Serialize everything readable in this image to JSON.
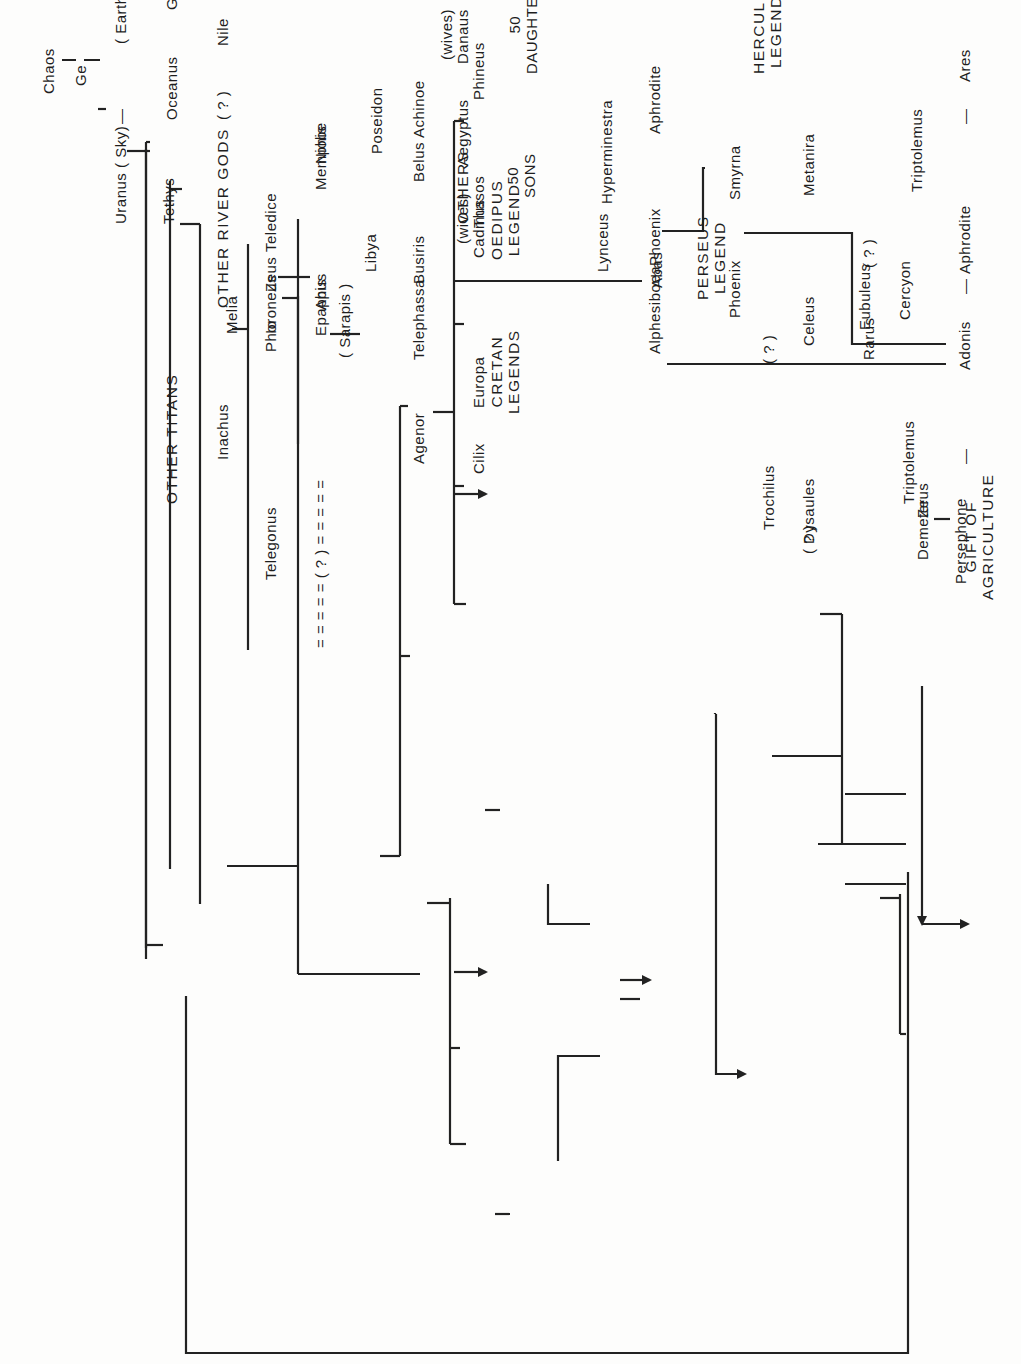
{
  "diagram": {
    "orientation": "rotated 90 degrees counter-clockwise",
    "line_color": "#222222",
    "labels": {
      "chaos": "Chaos",
      "ge_top": "Ge",
      "uranus": "Uranus ( Sky)",
      "earth_ge": "( Earth ) Ge",
      "tethys": "Tethys",
      "other_titans": "OTHER TITANS",
      "oceanus": "Oceanus",
      "ge_left": "Ge",
      "other_river_gods": "OTHER RIVER GODS",
      "inachus": "Inachus",
      "melia": "Melia",
      "phoroneus": "Phoroneus",
      "teledice": "Teledice",
      "niobe": "Niobe",
      "apis": "Apis",
      "sarapis": "( Sarapis )",
      "io": "Io",
      "telegonus": "Telegonus",
      "zeus_io": "Zeus",
      "epaphus": "Epaphus",
      "dashed_link": "= = = = = ( ? ) = = = = =",
      "memphis": "Memphis",
      "libya": "Libya",
      "nile": "Nile",
      "unknown_nile": "( ? )",
      "poseidon": "Poseidon",
      "belus": "Belus",
      "achinoe": "Achinoe",
      "aegyptus": "Aegyptus",
      "wives_aeg": "(wives)",
      "fifty_sons": "50\nSONS",
      "others": "OTHERS",
      "danaus": "Danaus",
      "wives_dan": "(wives)",
      "fifty_daughters": "50\nDAUGHTERS",
      "lynceus": "Lynceus",
      "hyperminestra": "Hyperminestra",
      "abas": "Abas",
      "perseus_legend": "PERSEUS\nLEGEND",
      "hercules_legends": "HERCULES\nLEGENDS",
      "busiris": "Busiris",
      "agenor": "Agenor",
      "telephassa": "Telephassa",
      "cadmus": "Cadmus",
      "oedipus_legend": "OEDIPUS\nLEGEND",
      "europa": "Europa",
      "cretan_legends": "CRETAN\nLEGENDS",
      "cilix": "Cilix",
      "thasos": "Thasos",
      "phineus": "Phineus",
      "phoenix_1": "Phoenix",
      "aphrodite_1": "Aphrodite",
      "alphesiboea": "Alphesiboea",
      "phoenix_2": "Phoenix",
      "smyrna": "Smyrna",
      "adonis": "Adonis",
      "aphrodite_2": "Aphrodite",
      "ares": "Ares",
      "dash_adonis_left": "—",
      "dash_adonis_right": "—",
      "dash_ares": "—",
      "metanira": "Metanira",
      "celeus": "Celeus",
      "unknown_trochilus": "( ? )",
      "trochilus": "Trochilus",
      "unknown_dysaules": "( ? )",
      "dysaules": "Dysaules",
      "eubuleus": "Eubuleus",
      "demeter": "Demeter",
      "zeus_dem": "Zeus",
      "persephone": "Persephone",
      "triptolemus_1": "Triptolemus",
      "triptolemus_2": "Triptolemus",
      "gift_of_agriculture": "GIFT OF\nAGRICULTURE",
      "rarus": "Rarus",
      "unknown_rarus": "( ? )",
      "cercyon": "Cercyon",
      "dash_io": "—"
    }
  }
}
